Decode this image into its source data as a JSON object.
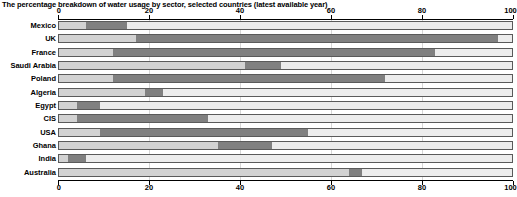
{
  "chart_data": {
    "type": "bar",
    "orientation": "horizontal",
    "stacked": true,
    "title": "The percentage breakdown of water usage by sector, selected countries (latest available year)",
    "xlabel": "",
    "ylabel": "",
    "xlim": [
      0,
      100
    ],
    "xticks": [
      0,
      20,
      40,
      60,
      80,
      100
    ],
    "xtick_labels": [
      "0",
      "20",
      "40",
      "60",
      "80",
      "100"
    ],
    "grid": true,
    "legend": null,
    "categories": [
      "Mexico",
      "UK",
      "France",
      "Saudi Arabia",
      "Poland",
      "Algeria",
      "Egypt",
      "CIS",
      "USA",
      "Ghana",
      "India",
      "Australia"
    ],
    "series": [
      {
        "name": "Domestic",
        "color": "#d2d2d2",
        "values": [
          6,
          17,
          12,
          41,
          12,
          19,
          4,
          4,
          9,
          35,
          2,
          64
        ]
      },
      {
        "name": "Industry",
        "color": "#808080",
        "values": [
          9,
          80,
          71,
          8,
          60,
          4,
          5,
          29,
          46,
          12,
          4,
          3
        ]
      },
      {
        "name": "Agriculture",
        "color": "#ececec",
        "values": [
          85,
          3,
          17,
          51,
          28,
          77,
          91,
          67,
          45,
          53,
          94,
          33
        ]
      }
    ]
  }
}
